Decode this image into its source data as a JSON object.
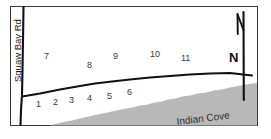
{
  "figure": {
    "kind": "parcel-plat-map",
    "background_color": "#ffffff",
    "frame_color": "#3a3a3a",
    "line_color": "#111111",
    "water_fill_color": "#b8b8b8"
  },
  "roads": [
    {
      "id": "squaw-bay-rd",
      "label": "Squaw Bay Rd",
      "orientation": "vertical"
    },
    {
      "id": "shore-rd",
      "label": "",
      "orientation": "diagonal"
    }
  ],
  "water": {
    "label": "Indian Cove",
    "fill": "#b8b8b8"
  },
  "compass": {
    "label": "N"
  },
  "parcels_upper": [
    {
      "num": "7"
    },
    {
      "num": "8"
    },
    {
      "num": "9"
    },
    {
      "num": "10"
    },
    {
      "num": "11"
    }
  ],
  "parcels_lower": [
    {
      "num": "1"
    },
    {
      "num": "2"
    },
    {
      "num": "3"
    },
    {
      "num": "4"
    },
    {
      "num": "5"
    },
    {
      "num": "6"
    }
  ]
}
